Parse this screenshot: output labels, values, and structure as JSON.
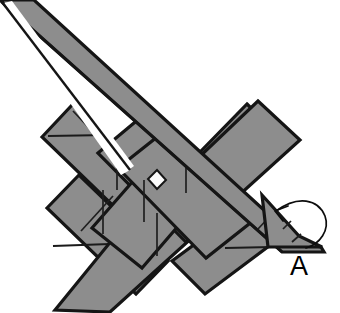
{
  "figure": {
    "kind": "line-art technical diagram",
    "background_color": "#ffffff",
    "strip_fill_color": "#8d8d8d",
    "outline_color": "#151515",
    "highlight_color": "#ffffff",
    "hatch_color": "#1a1a1a"
  },
  "annotations": {
    "label_a": "A",
    "arrow_icon_name": "curved-direction-arrow",
    "arrow_description": "curved arrow wrapping the lower-right strip tip, pointing up-left"
  },
  "components": {
    "long_diagonal_strip": "long flat strip running from upper-left corner down to lower-right tip",
    "left_diamond": "diamond-shaped strip end, mid-left",
    "right_diamond": "diamond-shaped strip end, upper-right",
    "lower_left_diamond": "diamond-shaped strip end, lower-left",
    "lower_right_diamond": "diamond-shaped strip end, lower-right",
    "center_gap": "small white square opening at the weave crossing point"
  }
}
